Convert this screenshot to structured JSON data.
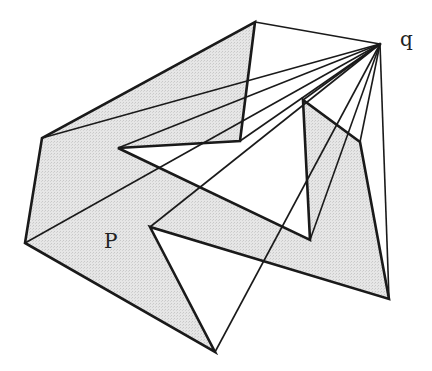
{
  "figure": {
    "width": 432,
    "height": 371,
    "colors": {
      "fill": "#e2e2e2",
      "stroke": "#1a1a1a",
      "visibility_line": "#1a1a1a",
      "background": "#ffffff"
    },
    "polygon": {
      "name": "P",
      "vertices": [
        [
          255,
          22
        ],
        [
          240,
          141
        ],
        [
          118,
          148
        ],
        [
          310,
          240
        ],
        [
          303,
          100
        ],
        [
          360,
          142
        ],
        [
          389,
          299
        ],
        [
          150,
          227
        ],
        [
          215,
          352
        ],
        [
          25,
          243
        ],
        [
          42,
          138
        ]
      ]
    },
    "point_q": {
      "name": "q",
      "position": [
        380,
        44
      ]
    },
    "visibility_lines": [
      {
        "from": [
          380,
          44
        ],
        "to": [
          255,
          22
        ]
      },
      {
        "from": [
          380,
          44
        ],
        "to": [
          42,
          138
        ]
      },
      {
        "from": [
          380,
          44
        ],
        "to": [
          118,
          148
        ]
      },
      {
        "from": [
          380,
          44
        ],
        "to": [
          240,
          141
        ]
      },
      {
        "from": [
          380,
          44
        ],
        "to": [
          25,
          243
        ]
      },
      {
        "from": [
          380,
          44
        ],
        "to": [
          150,
          227
        ]
      },
      {
        "from": [
          380,
          44
        ],
        "to": [
          303,
          100
        ]
      },
      {
        "from": [
          380,
          44
        ],
        "to": [
          215,
          352
        ]
      },
      {
        "from": [
          380,
          44
        ],
        "to": [
          310,
          240
        ]
      },
      {
        "from": [
          380,
          44
        ],
        "to": [
          360,
          142
        ]
      },
      {
        "from": [
          380,
          44
        ],
        "to": [
          389,
          299
        ]
      }
    ],
    "labels": [
      {
        "id": "label-P",
        "text": "P",
        "x": 104,
        "y": 248
      },
      {
        "id": "label-q",
        "text": "q",
        "x": 400,
        "y": 46
      }
    ]
  }
}
